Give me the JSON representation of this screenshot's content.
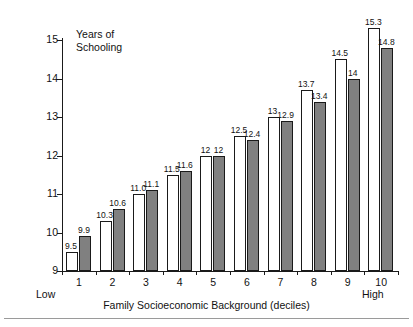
{
  "chart_data": {
    "type": "bar",
    "title": "",
    "ylabel": "Years of\nSchooling",
    "ylabel_line1": "Years of",
    "ylabel_line2": "Schooling",
    "xlabel": "Family Socioeconomic Background (deciles)",
    "x_axis_low_anchor": "Low",
    "x_axis_high_anchor": "High",
    "categories": [
      "1",
      "2",
      "3",
      "4",
      "5",
      "6",
      "7",
      "8",
      "9",
      "10"
    ],
    "ylim": [
      9,
      15
    ],
    "y_ticks": [
      "9",
      "10",
      "11",
      "12",
      "13",
      "14",
      "15"
    ],
    "grid": false,
    "legend": false,
    "series": [
      {
        "name": "white-bar-series",
        "fill": "#ffffff",
        "values": [
          9.5,
          10.3,
          11.0,
          11.5,
          12,
          12.5,
          13,
          13.7,
          14.5,
          15.3
        ],
        "labels": [
          "9.5",
          "10.3",
          "11.0",
          "11.5",
          "12",
          "12.5",
          "13",
          "13.7",
          "14.5",
          "15.3"
        ]
      },
      {
        "name": "gray-bar-series",
        "fill": "#808080",
        "values": [
          9.9,
          10.6,
          11.1,
          11.6,
          12,
          12.4,
          12.9,
          13.4,
          14,
          14.8
        ],
        "labels": [
          "9.9",
          "10.6",
          "11.1",
          "11.6",
          "12",
          "12.4",
          "12.9",
          "13.4",
          "14",
          "14.8"
        ]
      }
    ]
  }
}
